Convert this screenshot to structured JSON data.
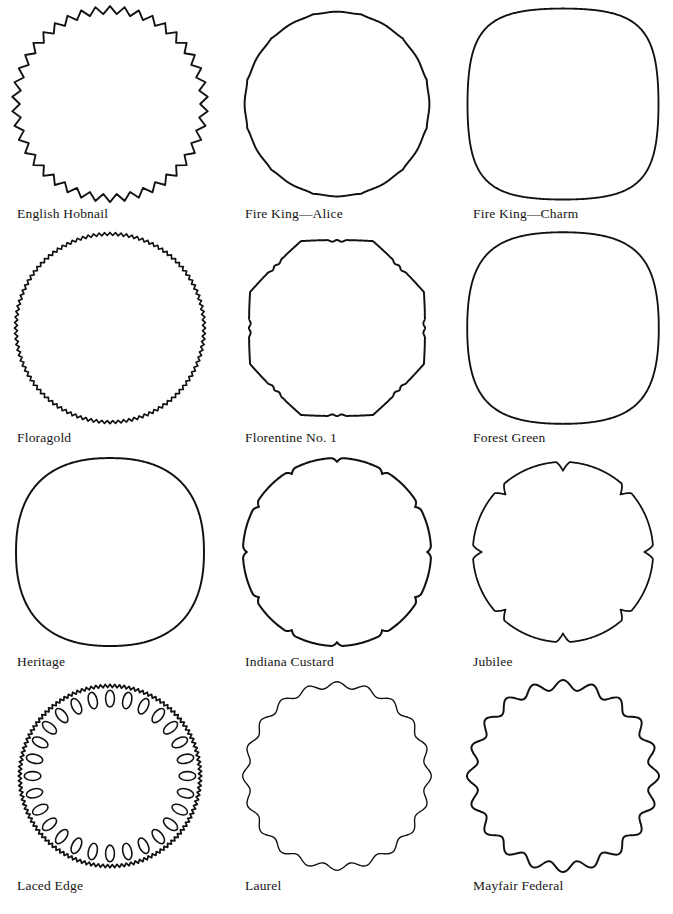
{
  "page": {
    "background_color": "#ffffff",
    "ink_color": "#111111",
    "columns": 3,
    "rows": 4
  },
  "figures": [
    {
      "id": "english-hobnail",
      "label": "English Hobnail",
      "row": 1,
      "column": 1,
      "shape": {
        "type": "zigzag-circle",
        "radius": 96,
        "teeth": 42,
        "amplitude": 4.0,
        "stroke_width": 1.9
      }
    },
    {
      "id": "fire-king-alice",
      "label": "Fire King—Alice",
      "row": 1,
      "column": 2,
      "shape": {
        "type": "rounded-polygon",
        "radius": 96,
        "sides": 12,
        "corner_round": 0.13,
        "flat_bulge": 0.012,
        "rotation": 15,
        "stroke_width": 2.0
      }
    },
    {
      "id": "fire-king-charm",
      "label": "Fire King—Charm",
      "row": 1,
      "column": 3,
      "shape": {
        "type": "squircle",
        "radius": 96,
        "exponent": 3.6,
        "bulge": 0.015,
        "stroke_width": 1.9
      }
    },
    {
      "id": "floragold",
      "label": "Floragold",
      "row": 2,
      "column": 1,
      "shape": {
        "type": "zigzag-circle",
        "radius": 96,
        "teeth": 108,
        "amplitude": 1.5,
        "stroke_width": 1.7
      }
    },
    {
      "id": "florentine-no-1",
      "label": "Florentine No. 1",
      "row": 2,
      "column": 2,
      "shape": {
        "type": "scalloped-polygon",
        "radius": 96,
        "sides": 8,
        "scallops_per_corner": 3,
        "scallop_depth": 2.6,
        "corner_round": 0.16,
        "rotation": 22.5,
        "stroke_width": 2.0
      }
    },
    {
      "id": "forest-green",
      "label": "Forest Green",
      "row": 2,
      "column": 3,
      "shape": {
        "type": "squircle",
        "radius": 96,
        "exponent": 3.3,
        "bulge": 0.018,
        "stroke_width": 1.9
      }
    },
    {
      "id": "heritage",
      "label": "Heritage",
      "row": 3,
      "column": 1,
      "shape": {
        "type": "squircle",
        "radius": 94,
        "exponent": 2.8,
        "bulge": 0.02,
        "stroke_width": 2.0
      }
    },
    {
      "id": "indiana-custard",
      "label": "Indiana Custard",
      "row": 3,
      "column": 2,
      "shape": {
        "type": "notched-circle",
        "radius": 96,
        "notches": 12,
        "notch_depth": 4.0,
        "notch_width": 0.13,
        "stroke_width": 2.1
      }
    },
    {
      "id": "jubilee",
      "label": "Jubilee",
      "row": 3,
      "column": 3,
      "shape": {
        "type": "cusped-lobes",
        "radius": 92,
        "lobes": 8,
        "cusp_depth": 9.0,
        "stroke_width": 1.8
      }
    },
    {
      "id": "laced-edge",
      "label": "Laced Edge",
      "row": 4,
      "column": 1,
      "shape": {
        "type": "laced-circle",
        "radius": 92,
        "teeth": 120,
        "amplitude": 1.6,
        "holes": 28,
        "hole_ring_radius": 79,
        "hole_length": 17,
        "hole_width": 9,
        "stroke_width": 1.8,
        "hole_stroke_width": 1.6
      }
    },
    {
      "id": "laurel",
      "label": "Laurel",
      "row": 4,
      "column": 2,
      "shape": {
        "type": "scalloped-circle",
        "radius": 93,
        "scallops": 20,
        "amplitude": 3.2,
        "stroke_width": 1.4
      }
    },
    {
      "id": "mayfair-federal",
      "label": "Mayfair Federal",
      "row": 4,
      "column": 3,
      "shape": {
        "type": "scalloped-circle",
        "radius": 93,
        "scallops": 20,
        "amplitude": 5.0,
        "stroke_width": 2.0
      }
    }
  ]
}
